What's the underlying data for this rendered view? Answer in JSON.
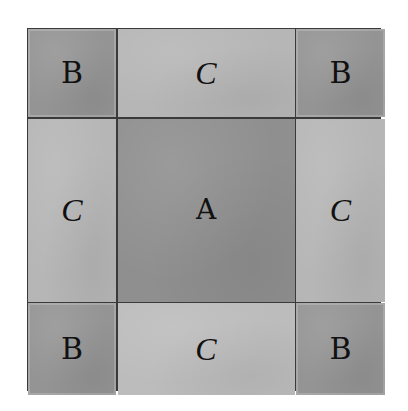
{
  "diagram": {
    "title": "",
    "grid": {
      "rows": 3,
      "columns": 3,
      "cells": [
        {
          "row": 0,
          "col": 0,
          "label": "B",
          "shade": "#949494"
        },
        {
          "row": 0,
          "col": 1,
          "label": "C",
          "shade": "#b6b6b6"
        },
        {
          "row": 0,
          "col": 2,
          "label": "B",
          "shade": "#949494"
        },
        {
          "row": 1,
          "col": 0,
          "label": "C",
          "shade": "#b6b6b6"
        },
        {
          "row": 1,
          "col": 1,
          "label": "A",
          "shade": "#8f8f8f"
        },
        {
          "row": 1,
          "col": 2,
          "label": "C",
          "shade": "#b6b6b6"
        },
        {
          "row": 2,
          "col": 0,
          "label": "B",
          "shade": "#949494"
        },
        {
          "row": 2,
          "col": 1,
          "label": "C",
          "shade": "#bcbcbc"
        },
        {
          "row": 2,
          "col": 2,
          "label": "B",
          "shade": "#949494"
        }
      ]
    },
    "colors": {
      "outline": "#3a3a3a",
      "label_ink": "#111111",
      "background": "#ffffff"
    }
  }
}
